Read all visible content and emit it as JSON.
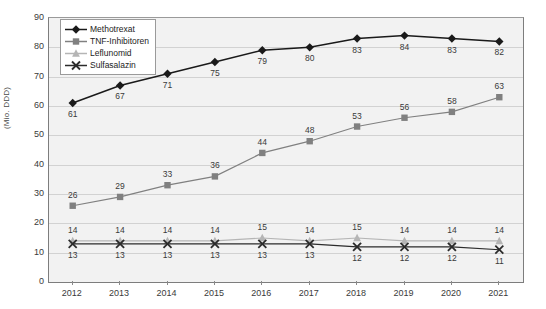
{
  "chart_data": {
    "type": "line",
    "title": "",
    "xlabel": "",
    "ylabel": "(Mio. DDD)",
    "categories": [
      "2012",
      "2013",
      "2014",
      "2015",
      "2016",
      "2017",
      "2018",
      "2019",
      "2020",
      "2021"
    ],
    "ylim": [
      0,
      90
    ],
    "ytick_step": 10,
    "yticks": [
      "0",
      "10",
      "20",
      "30",
      "40",
      "50",
      "60",
      "70",
      "80",
      "90"
    ],
    "grid": true,
    "legend_position": "top-left-inside",
    "series": [
      {
        "name": "Methotrexat",
        "marker": "diamond",
        "color": "#1a1a1a",
        "label_offset": "below",
        "values": [
          61,
          67,
          71,
          75,
          79,
          80,
          83,
          84,
          83,
          82
        ]
      },
      {
        "name": "TNF-Inhibitoren",
        "marker": "square",
        "color": "#808080",
        "label_offset": "above",
        "values": [
          26,
          29,
          33,
          36,
          44,
          48,
          53,
          56,
          58,
          63
        ]
      },
      {
        "name": "Leflunomid",
        "marker": "triangle",
        "color": "#b5b5b5",
        "label_offset": "above",
        "values": [
          14,
          14,
          14,
          14,
          15,
          14,
          15,
          14,
          14,
          14
        ]
      },
      {
        "name": "Sulfasalazin",
        "marker": "cross",
        "color": "#2b2b2b",
        "label_offset": "below",
        "values": [
          13,
          13,
          13,
          13,
          13,
          13,
          12,
          12,
          12,
          11
        ]
      }
    ]
  },
  "colors": {
    "plot_background": "#f2f2f2",
    "gridline": "#d2d2d2",
    "axis": "#7d7d7d",
    "text": "#3a3a3a",
    "legend_border": "#9a9a9a"
  }
}
